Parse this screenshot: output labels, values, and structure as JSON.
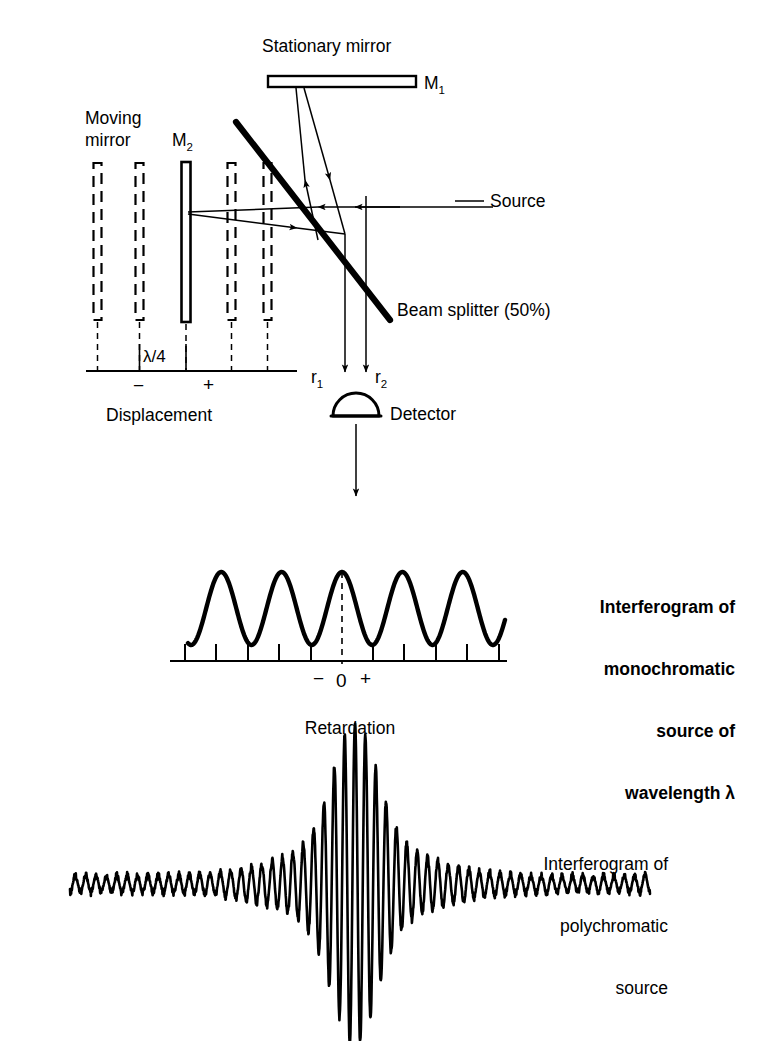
{
  "figure": {
    "background": "#ffffff",
    "ink": "#000000"
  },
  "interferometer": {
    "labels": {
      "stationary_mirror": "Stationary mirror",
      "mirror_1": "M",
      "mirror_1_sub": "1",
      "moving_mirror_line1": "Moving",
      "moving_mirror_line2": "mirror",
      "mirror_2": "M",
      "mirror_2_sub": "2",
      "source": "Source",
      "beam_splitter": "Beam splitter (50%)",
      "lambda_quarter": "λ/4",
      "minus": "−",
      "plus": "+",
      "displacement": "Displacement",
      "ray_1": "r",
      "ray_1_sub": "1",
      "ray_2": "r",
      "ray_2_sub": "2",
      "detector": "Detector"
    },
    "mirror_positions": [
      {
        "x": 97,
        "style": "dashed"
      },
      {
        "x": 139,
        "style": "dashed"
      },
      {
        "x": 186,
        "style": "solid"
      },
      {
        "x": 231,
        "style": "dashed"
      },
      {
        "x": 267,
        "style": "dashed"
      }
    ],
    "displacement_axis": {
      "x1": 88,
      "x2": 296,
      "y": 371,
      "tick_count": 5
    }
  },
  "chart_data": [
    {
      "type": "line",
      "name": "monochromatic-interferogram",
      "title": "Interferogram of monochromatic source of wavelength λ",
      "title_lines": [
        "Interferogram of",
        "monochromatic",
        "source of",
        "wavelength λ"
      ],
      "xlabel": "Retardation",
      "ylabel": "",
      "waveform": "cosine",
      "cycles": 5.25,
      "amplitude": 1,
      "phase_at_zero": "maximum",
      "x_range": [
        -2.62,
        2.62
      ],
      "xlim": [
        188,
        505
      ],
      "ylim": [
        0,
        1
      ],
      "grid": false,
      "axis": {
        "x1": 172,
        "x2": 506,
        "y": 661,
        "tick_count": 10,
        "tick_positions": [
          185,
          216,
          248,
          279,
          311,
          373,
          404,
          436,
          467,
          499
        ]
      },
      "zero_marker": {
        "x": 342,
        "label": "0",
        "dashed": true
      },
      "tick_labels": {
        "minus": "−",
        "zero": "0",
        "plus": "+"
      },
      "legend_position": "right"
    },
    {
      "type": "line",
      "name": "polychromatic-interferogram",
      "title": "Interferogram of polychromatic source",
      "title_lines": [
        "Interferogram of",
        "polychromatic",
        "source"
      ],
      "xlabel": "Retardation",
      "ylabel": "",
      "waveform": "damped-centerburst",
      "centerburst_x": 355,
      "carrier_cycles": 56,
      "envelope": "gaussian-plus-noise-floor",
      "peak_amplitude": 1.0,
      "wing_amplitude": 0.07,
      "x_range": [
        -1,
        1
      ],
      "xlim": [
        70,
        650
      ],
      "ylim": [
        -1.05,
        1.05
      ],
      "grid": false,
      "baseline_y": 884,
      "legend_position": "right"
    }
  ],
  "annotations": {
    "retardation": "Retardation",
    "mono_caption": [
      "Interferogram of",
      "monochromatic",
      "source of",
      "wavelength λ"
    ],
    "poly_caption": [
      "Interferogram of",
      "polychromatic",
      "source"
    ]
  }
}
